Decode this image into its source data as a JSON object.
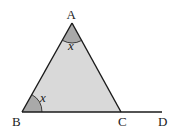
{
  "diagram": {
    "points": {
      "A": {
        "label": "A",
        "x": 72,
        "y": 23
      },
      "B": {
        "label": "B",
        "x": 22,
        "y": 112
      },
      "C": {
        "label": "C",
        "x": 121,
        "y": 112
      },
      "D": {
        "label": "D",
        "x": 162,
        "y": 112
      }
    },
    "angles": [
      {
        "vertex": "A",
        "label": "x"
      },
      {
        "vertex": "B",
        "label": "x"
      }
    ],
    "colors": {
      "triangle_fill": "#d9d9d9",
      "angle_fill": "#a9a9a9",
      "stroke": "#1a1a1a"
    }
  }
}
